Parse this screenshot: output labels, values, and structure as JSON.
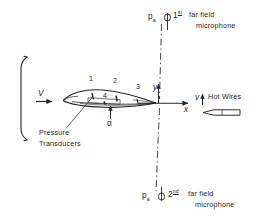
{
  "figure": {
    "type": "schematic",
    "background_color": "#ffffff",
    "line_color": "#232323"
  },
  "jet": {
    "label": "nozzle-exit-lip",
    "flow_symbol": "V"
  },
  "airfoil": {
    "sensor_labels": [
      "1",
      "2",
      "3",
      "4"
    ],
    "angle_symbol": "α",
    "callout": {
      "line1": "Pressure",
      "line2": "Transducers"
    }
  },
  "axes": {
    "y_label": "y",
    "x_label": "x"
  },
  "hot_wires": {
    "velocity_symbol": "v",
    "label": "Hot Wires"
  },
  "microphones": [
    {
      "pressure_symbol": "p",
      "pressure_subscript": "a",
      "ordinal_number": "1",
      "ordinal_suffix": "st",
      "line1": "far field",
      "line2": "microphone",
      "position": "top"
    },
    {
      "pressure_symbol": "p",
      "pressure_subscript": "a",
      "ordinal_number": "2",
      "ordinal_suffix": "nd",
      "line1": "far field",
      "line2": "microphone",
      "position": "bottom"
    }
  ]
}
